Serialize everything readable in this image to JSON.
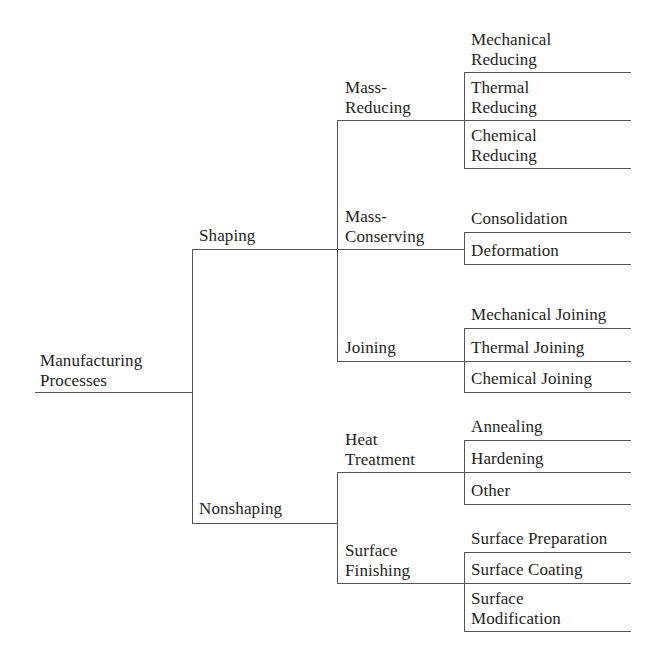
{
  "diagram": {
    "type": "tree",
    "orientation": "left-to-right",
    "root": {
      "label": "Manufacturing\nProcesses",
      "children": [
        {
          "label": "Shaping",
          "children": [
            {
              "label": "Mass-\nReducing",
              "children": [
                {
                  "label": "Mechanical\nReducing"
                },
                {
                  "label": "Thermal\nReducing"
                },
                {
                  "label": "Chemical\nReducing"
                }
              ]
            },
            {
              "label": "Mass-\nConserving",
              "children": [
                {
                  "label": "Consolidation"
                },
                {
                  "label": "Deformation"
                }
              ]
            },
            {
              "label": "Joining",
              "children": [
                {
                  "label": "Mechanical Joining"
                },
                {
                  "label": "Thermal Joining"
                },
                {
                  "label": "Chemical Joining"
                }
              ]
            }
          ]
        },
        {
          "label": "Nonshaping",
          "children": [
            {
              "label": "Heat\nTreatment",
              "children": [
                {
                  "label": "Annealing"
                },
                {
                  "label": "Hardening"
                },
                {
                  "label": "Other"
                }
              ]
            },
            {
              "label": "Surface\nFinishing",
              "children": [
                {
                  "label": "Surface Preparation"
                },
                {
                  "label": "Surface Coating"
                },
                {
                  "label": "Surface\nModification"
                }
              ]
            }
          ]
        }
      ]
    },
    "line_color": "#555555",
    "text_color": "#1e1e1e"
  }
}
